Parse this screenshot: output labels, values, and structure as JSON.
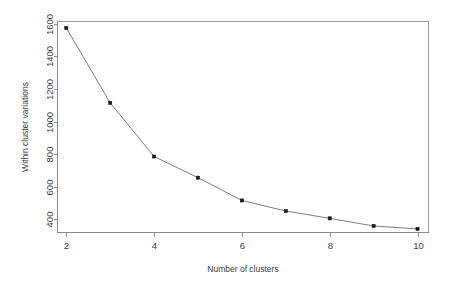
{
  "chart_data": {
    "type": "line",
    "title": "",
    "subtitle": "",
    "xlabel": "Number of clusters",
    "ylabel": "Within cluster variations",
    "x": [
      2,
      3,
      4,
      5,
      6,
      7,
      8,
      9,
      10
    ],
    "values": [
      1575,
      1115,
      785,
      655,
      515,
      450,
      405,
      358,
      340
    ],
    "series": [
      {
        "name": "Within cluster variations",
        "values": [
          1575,
          1115,
          785,
          655,
          515,
          450,
          405,
          358,
          340
        ]
      }
    ],
    "xlim": [
      1.8,
      10.25
    ],
    "ylim": [
      318,
      1615
    ],
    "x_ticks": [
      2,
      4,
      6,
      8,
      10
    ],
    "x_tick_labels": [
      "2",
      "4",
      "6",
      "8",
      "10"
    ],
    "y_ticks": [
      400,
      600,
      800,
      1000,
      1200,
      1400,
      1600
    ],
    "y_tick_labels": [
      "400",
      "600",
      "800",
      "1000",
      "1200",
      "1400",
      "1600"
    ],
    "grid": false,
    "legend": false,
    "legend_position": "none",
    "marker": "filled-square",
    "line_color": "#7c7c7c",
    "marker_color": "#1a1a1a",
    "background_color": "#ffffff",
    "frame": true
  },
  "axes": {
    "x_title": "Number of clusters",
    "y_title": "Within cluster variations"
  }
}
